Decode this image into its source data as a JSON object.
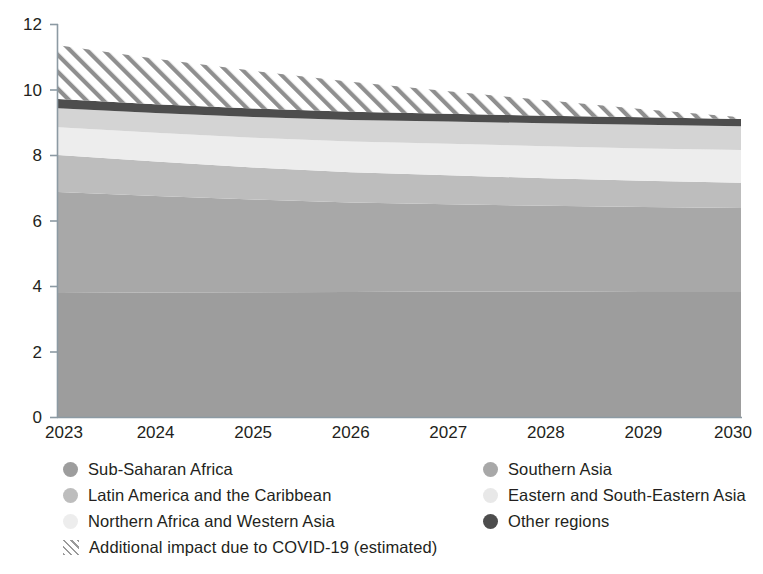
{
  "chart_data": {
    "type": "area",
    "stacked": true,
    "title": "",
    "subtitle": "",
    "xlabel": "",
    "ylabel": "",
    "categories": [
      "2023",
      "2024",
      "2025",
      "2026",
      "2027",
      "2028",
      "2029",
      "2030"
    ],
    "x_tick_labels": [
      "2023",
      "2024",
      "2025",
      "2026",
      "2027",
      "2028",
      "2029",
      "2030"
    ],
    "y_tick_labels": [
      "0",
      "2",
      "4",
      "6",
      "8",
      "10",
      "12"
    ],
    "y_ticks": [
      0,
      2,
      4,
      6,
      8,
      10,
      12
    ],
    "ylim": [
      0,
      12
    ],
    "xlim": [
      "2023",
      "2030"
    ],
    "grid": false,
    "legend_position": "bottom",
    "series": [
      {
        "name": "Sub-Saharan Africa",
        "color": "#9d9d9d",
        "values": [
          3.79,
          3.8,
          3.81,
          3.82,
          3.83,
          3.83,
          3.82,
          3.82
        ]
      },
      {
        "name": "Southern Asia",
        "color": "#a8a8a8",
        "values": [
          3.08,
          2.95,
          2.83,
          2.73,
          2.67,
          2.62,
          2.59,
          2.56
        ]
      },
      {
        "name": "Latin America and the Caribbean",
        "color": "#bdbdbd",
        "values": [
          1.13,
          1.05,
          0.98,
          0.92,
          0.88,
          0.84,
          0.8,
          0.77
        ]
      },
      {
        "name": "Eastern and South-Eastern Asia",
        "color": "#ededed",
        "values": [
          0.85,
          0.88,
          0.91,
          0.94,
          0.96,
          0.98,
          0.99,
          1.0
        ]
      },
      {
        "name": "Northern Africa and Western Asia",
        "color": "#d4d4d4",
        "values": [
          0.58,
          0.6,
          0.63,
          0.66,
          0.68,
          0.7,
          0.72,
          0.73
        ]
      },
      {
        "name": "Other regions",
        "color": "#4d4d4d",
        "values": [
          0.28,
          0.27,
          0.26,
          0.25,
          0.24,
          0.23,
          0.23,
          0.22
        ]
      },
      {
        "name": "Additional impact due to COVID-19 (estimated)",
        "color": "#9a9a9a",
        "pattern": "diagonal-hatch",
        "values": [
          1.64,
          1.39,
          1.15,
          0.92,
          0.69,
          0.47,
          0.25,
          0.05
        ]
      }
    ],
    "cumulative_tops": {
      "Sub-Saharan Africa": [
        3.79,
        3.8,
        3.81,
        3.82,
        3.83,
        3.83,
        3.82,
        3.82
      ],
      "Southern Asia": [
        6.87,
        6.75,
        6.64,
        6.55,
        6.5,
        6.45,
        6.41,
        6.38
      ],
      "Latin America and the Caribbean": [
        8.0,
        7.8,
        7.62,
        7.47,
        7.38,
        7.29,
        7.21,
        7.15
      ],
      "Eastern and South-Eastern Asia": [
        8.85,
        8.68,
        8.53,
        8.41,
        8.34,
        8.27,
        8.2,
        8.15
      ],
      "Northern Africa and Western Asia": [
        9.43,
        9.28,
        9.16,
        9.07,
        9.02,
        8.97,
        8.92,
        8.88
      ],
      "Other regions": [
        9.71,
        9.55,
        9.42,
        9.32,
        9.26,
        9.2,
        9.15,
        9.1
      ],
      "Additional impact due to COVID-19 (estimated)": [
        11.35,
        10.94,
        10.57,
        10.24,
        9.95,
        9.67,
        9.4,
        9.15
      ]
    }
  },
  "axes": {
    "y_ticks": [
      {
        "label": "12",
        "value": 12
      },
      {
        "label": "10",
        "value": 10
      },
      {
        "label": "8",
        "value": 8
      },
      {
        "label": "6",
        "value": 6
      },
      {
        "label": "4",
        "value": 4
      },
      {
        "label": "2",
        "value": 2
      },
      {
        "label": "0",
        "value": 0
      }
    ],
    "x_ticks": [
      {
        "label": "2023"
      },
      {
        "label": "2024"
      },
      {
        "label": "2025"
      },
      {
        "label": "2026"
      },
      {
        "label": "2027"
      },
      {
        "label": "2028"
      },
      {
        "label": "2029"
      },
      {
        "label": "2030"
      }
    ]
  },
  "legend": {
    "items": [
      {
        "label": "Sub-Saharan Africa",
        "color": "#9d9d9d",
        "marker": "circle",
        "column": "left",
        "row": 0
      },
      {
        "label": "Latin America and the Caribbean",
        "color": "#bdbdbd",
        "marker": "circle",
        "column": "left",
        "row": 1
      },
      {
        "label": "Northern Africa and Western Asia",
        "color": "#ededed",
        "marker": "circle",
        "column": "left",
        "row": 2
      },
      {
        "label": "Additional impact due to COVID-19 (estimated)",
        "color": "#9a9a9a",
        "marker": "hatch",
        "column": "left",
        "row": 3
      },
      {
        "label": "Southern Asia",
        "color": "#a8a8a8",
        "marker": "circle",
        "column": "right",
        "row": 0
      },
      {
        "label": "Eastern and South-Eastern Asia",
        "color": "#e8e8e8",
        "marker": "circle",
        "column": "right",
        "row": 1
      },
      {
        "label": "Other regions",
        "color": "#4d4d4d",
        "marker": "circle",
        "column": "right",
        "row": 2
      }
    ]
  },
  "colors": {
    "axis": "#8c9aa3",
    "text": "#231f20",
    "background": "#ffffff"
  }
}
